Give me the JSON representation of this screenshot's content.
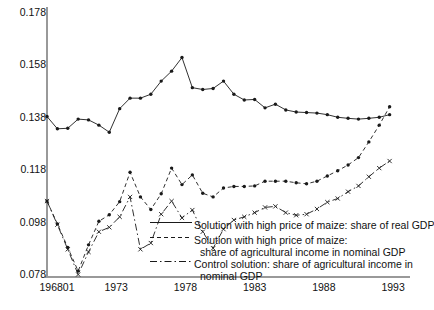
{
  "chart_data": {
    "type": "line",
    "title": "",
    "xlabel": "",
    "ylabel": "",
    "ylim": [
      0.078,
      0.178
    ],
    "ytick_labels": [
      "0.178",
      "0.158",
      "0.138",
      "0.118",
      "0.098",
      "0.078"
    ],
    "ytick_values": [
      0.178,
      0.158,
      0.138,
      0.118,
      0.098,
      0.078
    ],
    "xtick_labels": [
      "196801",
      "1973",
      "1978",
      "1983",
      "1988",
      "1993"
    ],
    "xtick_values": [
      1968.0,
      1973.0,
      1978.0,
      1983.0,
      1988.0,
      1993.0
    ],
    "xlim": [
      1968.0,
      1993.5
    ],
    "grid": false,
    "legend_position": "inside-lower-right",
    "series": [
      {
        "name": "Solution with high price of maize: share of real GDP",
        "style": "solid",
        "marker": "dot",
        "x": [
          1968.0,
          1968.75,
          1969.5,
          1970.25,
          1971.0,
          1971.75,
          1972.5,
          1973.25,
          1974.0,
          1974.75,
          1975.5,
          1976.25,
          1977.0,
          1977.75,
          1978.5,
          1979.25,
          1980.0,
          1980.75,
          1981.5,
          1982.25,
          1983.0,
          1983.75,
          1984.5,
          1985.25,
          1986.0,
          1986.75,
          1987.5,
          1988.25,
          1989.0,
          1989.75,
          1990.5,
          1991.25,
          1992.0,
          1992.75
        ],
        "values": [
          0.1385,
          0.1338,
          0.134,
          0.1375,
          0.1372,
          0.1352,
          0.1325,
          0.1415,
          0.1455,
          0.1455,
          0.147,
          0.152,
          0.1558,
          0.161,
          0.1495,
          0.1488,
          0.1492,
          0.152,
          0.147,
          0.1448,
          0.145,
          0.1418,
          0.1432,
          0.141,
          0.1402,
          0.14,
          0.1398,
          0.1392,
          0.1382,
          0.1378,
          0.1375,
          0.1378,
          0.1382,
          0.1392
        ]
      },
      {
        "name": "Solution with high price of maize: share of agricultural income in nominal GDP",
        "style": "dashed",
        "marker": "dot",
        "x": [
          1968.0,
          1968.75,
          1969.5,
          1970.25,
          1971.0,
          1971.75,
          1972.5,
          1973.25,
          1974.0,
          1974.75,
          1975.5,
          1976.25,
          1977.0,
          1977.75,
          1978.5,
          1979.25,
          1980.0,
          1980.75,
          1981.5,
          1982.25,
          1983.0,
          1983.75,
          1984.5,
          1985.25,
          1986.0,
          1986.75,
          1987.5,
          1988.25,
          1989.0,
          1989.75,
          1990.5,
          1991.25,
          1992.0,
          1992.75
        ],
        "values": [
          0.1062,
          0.0975,
          0.0885,
          0.0795,
          0.0895,
          0.0985,
          0.101,
          0.106,
          0.1172,
          0.1078,
          0.103,
          0.109,
          0.1188,
          0.1125,
          0.1162,
          0.1092,
          0.1078,
          0.1112,
          0.1118,
          0.1118,
          0.112,
          0.1138,
          0.1138,
          0.1138,
          0.1132,
          0.1128,
          0.1138,
          0.1158,
          0.1178,
          0.12,
          0.1228,
          0.1288,
          0.1352,
          0.1422
        ]
      },
      {
        "name": "Control solution: share of agricultural income in nominal GDP",
        "style": "dash-dot",
        "marker": "cross",
        "x": [
          1968.0,
          1968.75,
          1969.5,
          1970.25,
          1971.0,
          1971.75,
          1972.5,
          1973.25,
          1974.0,
          1974.75,
          1975.5,
          1976.25,
          1977.0,
          1977.75,
          1978.5,
          1979.25,
          1980.0,
          1980.75,
          1981.5,
          1982.25,
          1983.0,
          1983.75,
          1984.5,
          1985.25,
          1986.0,
          1986.75,
          1987.5,
          1988.25,
          1989.0,
          1989.75,
          1990.5,
          1991.25,
          1992.0,
          1992.75
        ],
        "values": [
          0.1062,
          0.0972,
          0.0878,
          0.0782,
          0.0868,
          0.0945,
          0.0962,
          0.1002,
          0.1078,
          0.0878,
          0.0902,
          0.1012,
          0.1062,
          0.0998,
          0.1028,
          0.0945,
          0.0882,
          0.0955,
          0.099,
          0.1002,
          0.1018,
          0.1038,
          0.1042,
          0.1018,
          0.1008,
          0.1012,
          0.1032,
          0.1058,
          0.1072,
          0.1098,
          0.112,
          0.1155,
          0.1188,
          0.1215
        ]
      }
    ],
    "legend": [
      {
        "style": "solid",
        "lines": [
          "Solution with high price of maize: share of real GDP"
        ]
      },
      {
        "style": "dashed",
        "lines": [
          "Solution with high price of maize:",
          "share of agricultural income in nominal GDP"
        ]
      },
      {
        "style": "dash-dot",
        "lines": [
          "Control solution: share of agricultural income in",
          "nominal GDP"
        ]
      }
    ]
  },
  "axis": {
    "line_color": "#999999",
    "data_color": "#1a1a1a"
  }
}
